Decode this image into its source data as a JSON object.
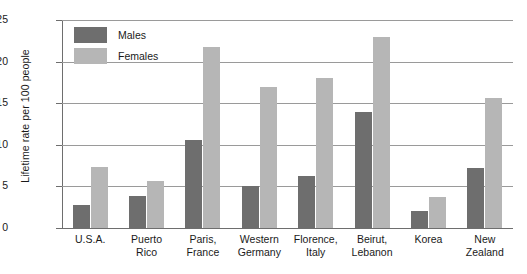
{
  "chart_data": {
    "type": "bar",
    "title": "",
    "subtitle": "",
    "xlabel": "",
    "ylabel": "Lifetime rate per 100 people",
    "ylim": [
      0,
      25
    ],
    "yticks": [
      0,
      5,
      10,
      15,
      20,
      25
    ],
    "ytick_labels": [
      "0",
      "5",
      "10",
      "15",
      "20",
      "25"
    ],
    "grid": true,
    "legend_position": "top-left",
    "categories": [
      "U.S.A.",
      "Puerto Rico",
      "Paris, France",
      "Western Germany",
      "Florence, Italy",
      "Beirut, Lebanon",
      "Korea",
      "New Zealand"
    ],
    "category_lines": [
      [
        "U.S.A."
      ],
      [
        "Puerto",
        "Rico"
      ],
      [
        "Paris,",
        "France"
      ],
      [
        "Western",
        "Germany"
      ],
      [
        "Florence,",
        "Italy"
      ],
      [
        "Beirut,",
        "Lebanon"
      ],
      [
        "Korea"
      ],
      [
        "New",
        "Zealand"
      ]
    ],
    "series": [
      {
        "name": "Males",
        "color": "#6e6e6e",
        "values": [
          2.8,
          3.9,
          10.6,
          5.0,
          6.2,
          14.0,
          2.1,
          7.2
        ]
      },
      {
        "name": "Females",
        "color": "#b6b6b6",
        "values": [
          7.3,
          5.7,
          21.8,
          17.0,
          18.0,
          23.0,
          3.7,
          15.6
        ]
      }
    ]
  },
  "legend": {
    "items": [
      {
        "label": "Males",
        "color": "#6e6e6e"
      },
      {
        "label": "Females",
        "color": "#b6b6b6"
      }
    ]
  },
  "axis": {
    "y_title": "Lifetime rate per 100 people"
  }
}
